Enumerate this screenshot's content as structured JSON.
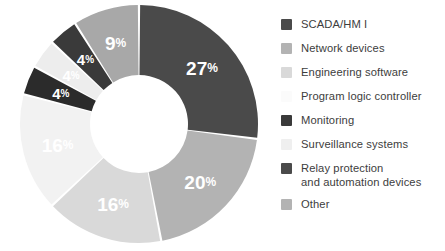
{
  "chart_data": {
    "type": "pie",
    "variant": "donut",
    "title": "",
    "subtitle": "",
    "xlabel": "",
    "ylabel": "",
    "legend_position": "right",
    "grid": false,
    "value_suffix": "%",
    "total": 100,
    "categories": [
      "SCADA/HM I",
      "Network devices",
      "Engineering software",
      "Program logic controller",
      "Monitoring",
      "Surveillance systems",
      "Relay protection\nand automation devices",
      "Other"
    ],
    "values": [
      27,
      20,
      16,
      16,
      4,
      4,
      4,
      9
    ],
    "colors": [
      "#4a4a4a",
      "#b3b3b3",
      "#d9d9d9",
      "#f2f2f2",
      "#3a3a3a",
      "#ededed",
      "#2b2b2b",
      "#a8a8a8"
    ],
    "slices": [
      {
        "label": "SCADA/HM I",
        "value": 27,
        "display": "27",
        "suffix": "%",
        "color": "#4a4a4a",
        "label_color": "#ffffff",
        "show_label": true,
        "size": "large"
      },
      {
        "label": "Network devices",
        "value": 20,
        "display": "20",
        "suffix": "%",
        "color": "#b3b3b3",
        "label_color": "#ffffff",
        "show_label": true,
        "size": "large"
      },
      {
        "label": "Engineering software",
        "value": 16,
        "display": "16",
        "suffix": "%",
        "color": "#d9d9d9",
        "label_color": "#ffffff",
        "show_label": true,
        "size": "large"
      },
      {
        "label": "Program logic controller",
        "value": 16,
        "display": "16",
        "suffix": "%",
        "color": "#f2f2f2",
        "label_color": "#ffffff",
        "show_label": true,
        "size": "large"
      },
      {
        "label": "Relay protection and automation devices",
        "value": 4,
        "display": "4",
        "suffix": "%",
        "color": "#2b2b2b",
        "label_color": "#ffffff",
        "show_label": true,
        "size": "small"
      },
      {
        "label": "Surveillance systems",
        "value": 4,
        "display": "4",
        "suffix": "%",
        "color": "#ededed",
        "label_color": "#ffffff",
        "show_label": true,
        "size": "small"
      },
      {
        "label": "Monitoring",
        "value": 4,
        "display": "4",
        "suffix": "%",
        "color": "#3a3a3a",
        "label_color": "#ffffff",
        "show_label": true,
        "size": "small"
      },
      {
        "label": "Other",
        "value": 9,
        "display": "9",
        "suffix": "%",
        "color": "#a8a8a8",
        "label_color": "#ffffff",
        "show_label": true,
        "size": "large"
      }
    ]
  },
  "legend": {
    "items": [
      {
        "label": "SCADA/HM I",
        "color": "#4a4a4a"
      },
      {
        "label": "Network devices",
        "color": "#b3b3b3"
      },
      {
        "label": "Engineering software",
        "color": "#d9d9d9"
      },
      {
        "label": "Program logic controller",
        "color": "#fbfbfb"
      },
      {
        "label": "Monitoring",
        "color": "#3a3a3a"
      },
      {
        "label": "Surveillance systems",
        "color": "#efefef"
      },
      {
        "label": "Relay protection\nand automation devices",
        "color": "#4a4a4a"
      },
      {
        "label": "Other",
        "color": "#b3b3b3"
      }
    ]
  },
  "geometry": {
    "center_x": 139,
    "center_y": 124,
    "outer_radius": 119,
    "inner_radius": 49,
    "label_radius": 84,
    "start_angle_deg": -90,
    "gap_deg": 1.1
  },
  "background": "#ffffff"
}
